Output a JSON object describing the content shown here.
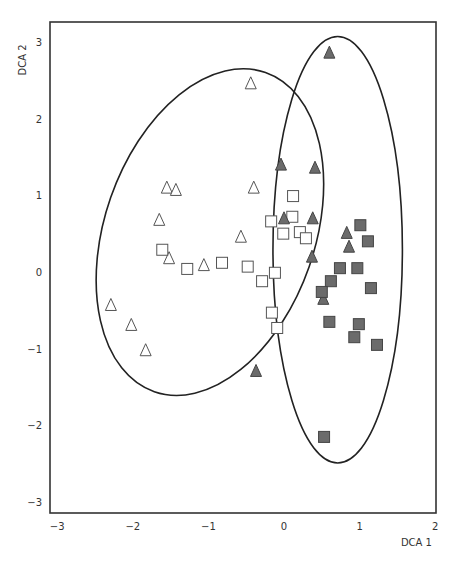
{
  "chart_data": {
    "type": "scatter",
    "title": "",
    "xlabel": "DCA 1",
    "ylabel": "DCA 2",
    "xlim": [
      -3,
      2
    ],
    "ylim": [
      -3,
      3
    ],
    "xticks": [
      -3,
      -2,
      -1,
      0,
      1,
      2
    ],
    "yticks": [
      -3,
      -2,
      -1,
      0,
      1,
      2,
      3
    ],
    "grid": false,
    "legend": null,
    "series": [
      {
        "name": "open-triangles",
        "marker": "triangle",
        "filled": false,
        "color": "#ffffff",
        "points": [
          [
            -0.44,
            2.46
          ],
          [
            -1.55,
            1.1
          ],
          [
            -1.43,
            1.07
          ],
          [
            -1.65,
            0.68
          ],
          [
            -0.4,
            1.1
          ],
          [
            -0.57,
            0.46
          ],
          [
            -1.52,
            0.18
          ],
          [
            -1.06,
            0.09
          ],
          [
            -2.29,
            -0.43
          ],
          [
            -2.02,
            -0.69
          ],
          [
            -1.83,
            -1.02
          ]
        ]
      },
      {
        "name": "open-squares",
        "marker": "square",
        "filled": false,
        "color": "#ffffff",
        "points": [
          [
            -1.61,
            0.29
          ],
          [
            -1.28,
            0.04
          ],
          [
            -0.82,
            0.12
          ],
          [
            -0.48,
            0.07
          ],
          [
            -0.29,
            -0.12
          ],
          [
            -0.12,
            -0.01
          ],
          [
            -0.16,
            -0.53
          ],
          [
            -0.09,
            -0.73
          ],
          [
            -0.17,
            0.66
          ],
          [
            0.12,
            0.99
          ],
          [
            0.11,
            0.72
          ],
          [
            -0.01,
            0.5
          ],
          [
            0.21,
            0.52
          ],
          [
            0.29,
            0.44
          ]
        ]
      },
      {
        "name": "filled-triangles",
        "marker": "triangle",
        "filled": true,
        "color": "#6b6b6b",
        "points": [
          [
            0.6,
            2.86
          ],
          [
            -0.04,
            1.4
          ],
          [
            0.41,
            1.36
          ],
          [
            0.0,
            0.7
          ],
          [
            0.38,
            0.7
          ],
          [
            0.37,
            0.2
          ],
          [
            0.83,
            0.51
          ],
          [
            0.86,
            0.33
          ],
          [
            0.52,
            -0.35
          ],
          [
            -0.37,
            -1.29
          ]
        ]
      },
      {
        "name": "filled-squares",
        "marker": "square",
        "filled": true,
        "color": "#6b6b6b",
        "points": [
          [
            1.01,
            0.61
          ],
          [
            1.11,
            0.4
          ],
          [
            0.74,
            0.05
          ],
          [
            0.97,
            0.05
          ],
          [
            0.62,
            -0.12
          ],
          [
            1.15,
            -0.21
          ],
          [
            0.5,
            -0.26
          ],
          [
            0.6,
            -0.65
          ],
          [
            0.99,
            -0.68
          ],
          [
            0.93,
            -0.85
          ],
          [
            1.23,
            -0.95
          ],
          [
            0.53,
            -2.15
          ]
        ]
      }
    ],
    "ellipses": [
      {
        "name": "open-group-ellipse",
        "center": [
          -0.98,
          0.52
        ],
        "semi_major": 2.22,
        "semi_minor": 1.38,
        "angle_deg": 70.8
      },
      {
        "name": "filled-group-ellipse",
        "center": [
          0.71,
          0.29
        ],
        "semi_major": 2.8,
        "semi_minor": 0.85,
        "angle_deg": 90
      }
    ]
  }
}
